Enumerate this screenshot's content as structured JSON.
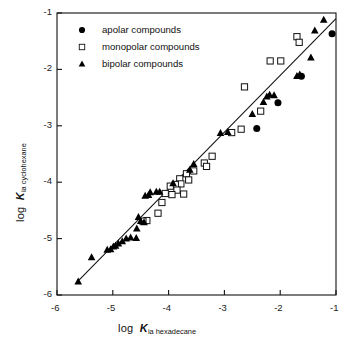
{
  "chart_data": {
    "type": "scatter",
    "title": "",
    "xlabel": "log K ia hexadecane",
    "ylabel": "log K ia cyclohexane",
    "xlim": [
      -6,
      -1
    ],
    "ylim": [
      -6,
      -1
    ],
    "xticks": [
      "-6",
      "-5",
      "-4",
      "-3",
      "-2",
      "-1"
    ],
    "yticks": [
      "-1",
      "-2",
      "-3",
      "-4",
      "-5",
      "-6"
    ],
    "xtick_values": [
      -6,
      -5,
      -4,
      -3,
      -2,
      -1
    ],
    "ytick_values": [
      -1,
      -2,
      -3,
      -4,
      -5,
      -6
    ],
    "grid": false,
    "legend_position": "top-left-inside",
    "trendline": {
      "x": [
        -5.65,
        -1.0
      ],
      "y": [
        -5.78,
        -1.1
      ]
    },
    "series": [
      {
        "name": "apolar compounds",
        "marker": "filled-circle",
        "color": "#000000",
        "points": [
          [
            -1.07,
            -1.37
          ],
          [
            -1.62,
            -2.12
          ],
          [
            -2.04,
            -2.59
          ],
          [
            -2.42,
            -3.05
          ]
        ]
      },
      {
        "name": "monopolar compounds",
        "marker": "open-square",
        "color": "#000000",
        "points": [
          [
            -1.7,
            -1.42
          ],
          [
            -1.66,
            -1.52
          ],
          [
            -1.99,
            -1.85
          ],
          [
            -2.18,
            -1.85
          ],
          [
            -2.64,
            -2.31
          ],
          [
            -2.35,
            -2.74
          ],
          [
            -2.7,
            -3.06
          ],
          [
            -2.87,
            -3.12
          ],
          [
            -3.22,
            -3.54
          ],
          [
            -3.36,
            -3.66
          ],
          [
            -3.32,
            -3.72
          ],
          [
            -3.55,
            -3.8
          ],
          [
            -3.68,
            -3.85
          ],
          [
            -3.8,
            -3.94
          ],
          [
            -3.64,
            -3.96
          ],
          [
            -3.78,
            -4.03
          ],
          [
            -3.88,
            -4.04
          ],
          [
            -3.97,
            -4.07
          ],
          [
            -3.85,
            -4.14
          ],
          [
            -3.73,
            -4.21
          ],
          [
            -3.94,
            -4.22
          ],
          [
            -4.06,
            -4.2
          ],
          [
            -4.12,
            -4.36
          ],
          [
            -4.19,
            -4.55
          ],
          [
            -4.39,
            -4.68
          ],
          [
            -4.46,
            -4.69
          ]
        ]
      },
      {
        "name": "bipolar compounds",
        "marker": "filled-triangle",
        "color": "#000000",
        "points": [
          [
            -1.22,
            -1.12
          ],
          [
            -1.38,
            -1.31
          ],
          [
            -1.45,
            -1.79
          ],
          [
            -1.65,
            -2.09
          ],
          [
            -1.7,
            -2.12
          ],
          [
            -2.11,
            -2.46
          ],
          [
            -2.19,
            -2.45
          ],
          [
            -2.24,
            -2.48
          ],
          [
            -2.3,
            -2.58
          ],
          [
            -2.5,
            -2.79
          ],
          [
            -2.94,
            -3.11
          ],
          [
            -3.07,
            -3.13
          ],
          [
            -3.55,
            -3.68
          ],
          [
            -3.62,
            -3.78
          ],
          [
            -3.92,
            -4.02
          ],
          [
            -4.16,
            -4.17
          ],
          [
            -4.22,
            -4.17
          ],
          [
            -4.33,
            -4.18
          ],
          [
            -4.36,
            -4.23
          ],
          [
            -4.42,
            -4.24
          ],
          [
            -4.54,
            -4.62
          ],
          [
            -4.5,
            -4.69
          ],
          [
            -4.44,
            -4.71
          ],
          [
            -4.57,
            -4.82
          ],
          [
            -4.58,
            -4.99
          ],
          [
            -4.68,
            -4.98
          ],
          [
            -4.76,
            -5.0
          ],
          [
            -4.83,
            -5.05
          ],
          [
            -4.9,
            -5.09
          ],
          [
            -4.95,
            -5.13
          ],
          [
            -4.99,
            -5.14
          ],
          [
            -5.04,
            -5.19
          ],
          [
            -5.1,
            -5.2
          ],
          [
            -5.38,
            -5.33
          ],
          [
            -5.62,
            -5.76
          ]
        ]
      }
    ]
  },
  "axes": {
    "x_label_prefix": "log",
    "x_label_symbol": "K",
    "x_label_sub": "ia hexadecane",
    "y_label_prefix": "log",
    "y_label_symbol": "K",
    "y_label_sub": "ia cyclohexane"
  },
  "legend": {
    "items": [
      {
        "label": "apolar compounds",
        "marker": "filled-circle"
      },
      {
        "label": "monopolar compounds",
        "marker": "open-square"
      },
      {
        "label": "bipolar compounds",
        "marker": "filled-triangle"
      }
    ]
  }
}
